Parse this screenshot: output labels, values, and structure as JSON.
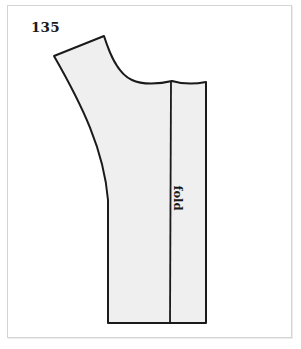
{
  "figure": {
    "number": "135",
    "fold_label": "fold",
    "fill_color": "#efefef",
    "stroke_color": "#1a1a1a",
    "frame_color": "#d4d4d4"
  }
}
